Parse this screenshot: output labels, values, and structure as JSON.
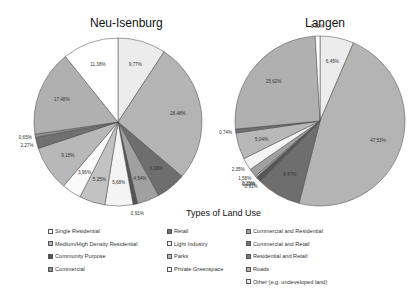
{
  "chart_data": [
    {
      "type": "pie",
      "title": "Neu-Isenburg",
      "labels": [
        "9,77%",
        "28,48%",
        "6,08%",
        "4,54%",
        "0,91%",
        "5,68%",
        "5,25%",
        "3,96%",
        "9,18%",
        "2,27%",
        "0,65%",
        "17,48%",
        "11,38%"
      ],
      "values": [
        9.77,
        28.48,
        6.08,
        4.54,
        0.91,
        5.68,
        5.25,
        3.96,
        9.18,
        2.27,
        0.65,
        17.48,
        11.38
      ],
      "colors": [
        "#ececec",
        "#b4b4b4",
        "#6e6e6e",
        "#a0a0a0",
        "#555555",
        "#f4f4f4",
        "#c2c2c2",
        "#fafafa",
        "#b8b8b8",
        "#707070",
        "#909090",
        "#b0b0b0",
        "#ffffff"
      ]
    },
    {
      "type": "pie",
      "title": "Langen",
      "labels": [
        "6,45%",
        "47,53%",
        "8,47%",
        "0,91%",
        "0,13%",
        "0,28%",
        "1,58%",
        "2,35%",
        "5,04%",
        "0,74%",
        "25,62%",
        "0,90%"
      ],
      "values": [
        6.45,
        47.53,
        8.47,
        0.91,
        0.13,
        0.28,
        1.58,
        2.35,
        5.04,
        0.74,
        25.62,
        0.9
      ],
      "colors": [
        "#ececec",
        "#b4b4b4",
        "#6e6e6e",
        "#555555",
        "#909090",
        "#c2c2c2",
        "#a0a0a0",
        "#f4f4f4",
        "#b8b8b8",
        "#707070",
        "#b0b0b0",
        "#ffffff"
      ]
    }
  ],
  "legend": {
    "title": "Types of Land Use",
    "items": [
      {
        "label": "Single Residential",
        "color": "#ffffff"
      },
      {
        "label": "Medium/High Density Residential",
        "color": "#b0b0b0"
      },
      {
        "label": "Community Purpose",
        "color": "#555555"
      },
      {
        "label": "Commercial",
        "color": "#909090"
      },
      {
        "label": "Retail",
        "color": "#6e6e6e"
      },
      {
        "label": "Light Industry",
        "color": "#f4f4f4"
      },
      {
        "label": "Parks",
        "color": "#b8b8b8"
      },
      {
        "label": "Private Greenspace",
        "color": "#fafafa"
      },
      {
        "label": "Commercial and Residential",
        "color": "#a0a0a0"
      },
      {
        "label": "Commercial and Retail",
        "color": "#707070"
      },
      {
        "label": "Residential and Retail",
        "color": "#7a7a7a"
      },
      {
        "label": "Roads",
        "color": "#b4b4b4"
      },
      {
        "label": "Other (e.g. undeveloped land)",
        "color": "#ececec"
      }
    ]
  }
}
